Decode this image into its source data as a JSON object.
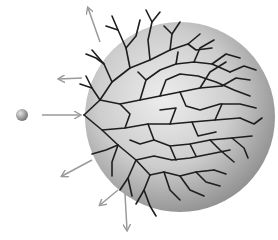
{
  "diagram": {
    "colors": {
      "background": "#ffffff",
      "sphere_light": "#e6e6e6",
      "sphere_dark": "#8f8f8f",
      "branches": "#1e1e1e",
      "arrows": "#9a9a9a",
      "particle_light": "#d8d8d8",
      "particle_dark": "#7a7a7a"
    },
    "sphere": {
      "cx": 180,
      "cy": 117,
      "r": 95
    },
    "particle": {
      "cx": 22,
      "cy": 115,
      "r": 6
    },
    "incoming_arrow": {
      "x1": 42,
      "y1": 115,
      "x2": 80,
      "y2": 115
    },
    "outgoing_arrows": [
      {
        "x1": 100,
        "y1": 40,
        "x2": 88,
        "y2": 7
      },
      {
        "x1": 80,
        "y1": 78,
        "x2": 58,
        "y2": 79
      },
      {
        "x1": 90,
        "y1": 160,
        "x2": 62,
        "y2": 176
      },
      {
        "x1": 118,
        "y1": 190,
        "x2": 100,
        "y2": 205
      },
      {
        "x1": 125,
        "y1": 193,
        "x2": 127,
        "y2": 230
      }
    ]
  }
}
